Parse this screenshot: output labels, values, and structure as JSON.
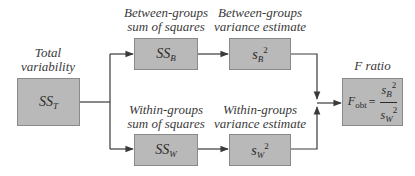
{
  "diagram": {
    "total": {
      "label_line1": "Total",
      "label_line2": "variability",
      "symbol": "SS",
      "subscript": "T"
    },
    "between_ss": {
      "label_line1": "Between-groups",
      "label_line2": "sum of squares",
      "symbol": "SS",
      "subscript": "B"
    },
    "between_var": {
      "label_line1": "Between-groups",
      "label_line2": "variance estimate",
      "symbol": "s",
      "subscript": "B",
      "superscript": "2"
    },
    "within_ss": {
      "label_line1": "Within-groups",
      "label_line2": "sum of squares",
      "symbol": "SS",
      "subscript": "W"
    },
    "within_var": {
      "label_line1": "Within-groups",
      "label_line2": "variance estimate",
      "symbol": "s",
      "subscript": "W",
      "superscript": "2"
    },
    "f_ratio": {
      "label": "F ratio",
      "lhs_symbol": "F",
      "lhs_subscript": "obt",
      "equals": "=",
      "num_symbol": "s",
      "num_subscript": "B",
      "num_superscript": "2",
      "den_symbol": "s",
      "den_subscript": "W",
      "den_superscript": "2"
    },
    "colors": {
      "box_fill": "#b9b9b9",
      "box_border": "#8a8a8a",
      "line": "#3a3a3a"
    }
  }
}
